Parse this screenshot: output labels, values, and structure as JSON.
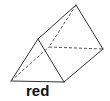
{
  "diagram": {
    "shape": "triangular-prism",
    "label": "red",
    "stroke_color": "#333333",
    "vertices": {
      "front_top": [
        38,
        39
      ],
      "front_bottom_left": [
        11,
        81
      ],
      "front_bottom_right": [
        64,
        82
      ],
      "back_top": [
        76,
        5
      ],
      "back_bottom_left_hidden": [
        49,
        47
      ],
      "back_bottom_right": [
        103,
        49
      ]
    },
    "edges_solid": [
      [
        "front_top",
        "front_bottom_left"
      ],
      [
        "front_top",
        "front_bottom_right"
      ],
      [
        "front_bottom_left",
        "front_bottom_right"
      ],
      [
        "front_top",
        "back_top"
      ],
      [
        "back_top",
        "back_bottom_right"
      ],
      [
        "front_bottom_right",
        "back_bottom_right"
      ]
    ],
    "edges_dashed": [
      [
        "back_top",
        "back_bottom_left_hidden"
      ],
      [
        "front_bottom_left",
        "back_bottom_left_hidden"
      ],
      [
        "back_bottom_left_hidden",
        "back_bottom_right"
      ]
    ]
  }
}
